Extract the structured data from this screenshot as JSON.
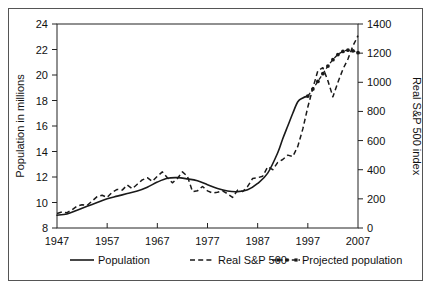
{
  "figure": {
    "background_color": "#ffffff",
    "frame_color": "#555555",
    "ink_color": "#1a1a1a"
  },
  "chart_data": {
    "type": "line",
    "title": "",
    "subtitle": "",
    "xlabel": "",
    "ylabel": "Population in millions",
    "y2label": "Real S&P 500 index",
    "xlim": [
      1947,
      2007
    ],
    "ylim": [
      8,
      24
    ],
    "y2lim": [
      0,
      1400
    ],
    "grid": false,
    "legend_position": "bottom",
    "xticks": [
      1947,
      1957,
      1967,
      1977,
      1987,
      1997,
      2007
    ],
    "xtick_labels": [
      "1947",
      "1957",
      "1967",
      "1977",
      "1987",
      "1997",
      "2007"
    ],
    "yticks": [
      8,
      10,
      12,
      14,
      16,
      18,
      20,
      22,
      24
    ],
    "ytick_labels": [
      "8",
      "10",
      "12",
      "14",
      "16",
      "18",
      "20",
      "22",
      "24"
    ],
    "y2ticks": [
      0,
      200,
      400,
      600,
      800,
      1000,
      1200,
      1400
    ],
    "y2tick_labels": [
      "0",
      "200",
      "400",
      "600",
      "800",
      "1000",
      "1200",
      "1400"
    ],
    "series": [
      {
        "name": "Population",
        "axis": "left",
        "style": "solid",
        "marker": "none",
        "x": [
          1947,
          1949,
          1951,
          1953,
          1955,
          1957,
          1959,
          1961,
          1963,
          1965,
          1967,
          1969,
          1971,
          1973,
          1975,
          1977,
          1979,
          1981,
          1983,
          1985,
          1987,
          1989,
          1991,
          1992,
          1993,
          1994,
          1995,
          1996,
          1997
        ],
        "values": [
          9.0,
          9.1,
          9.4,
          9.7,
          10.0,
          10.3,
          10.5,
          10.7,
          10.9,
          11.2,
          11.6,
          11.9,
          11.95,
          11.85,
          11.7,
          11.4,
          11.1,
          10.9,
          10.85,
          11.0,
          11.5,
          12.3,
          13.9,
          15.0,
          16.0,
          17.0,
          17.9,
          18.2,
          18.35
        ]
      },
      {
        "name": "Real S&P 500",
        "axis": "right",
        "style": "dashed",
        "marker": "none",
        "x": [
          1947,
          1948,
          1949,
          1950,
          1951,
          1952,
          1953,
          1954,
          1955,
          1956,
          1957,
          1958,
          1959,
          1960,
          1961,
          1962,
          1963,
          1964,
          1965,
          1966,
          1967,
          1968,
          1969,
          1970,
          1971,
          1972,
          1973,
          1974,
          1975,
          1976,
          1977,
          1978,
          1979,
          1980,
          1981,
          1982,
          1983,
          1984,
          1985,
          1986,
          1987,
          1988,
          1989,
          1990,
          1991,
          1992,
          1993,
          1994,
          1995,
          1996,
          1997,
          1998,
          1999,
          2000,
          2001,
          2002,
          2003,
          2004,
          2005,
          2006,
          2007
        ],
        "values": [
          100,
          110,
          105,
          125,
          150,
          160,
          155,
          185,
          215,
          225,
          210,
          245,
          265,
          260,
          295,
          270,
          300,
          330,
          345,
          320,
          355,
          385,
          345,
          310,
          340,
          385,
          355,
          250,
          255,
          285,
          255,
          240,
          245,
          255,
          235,
          210,
          260,
          250,
          285,
          340,
          345,
          355,
          420,
          400,
          450,
          470,
          500,
          490,
          560,
          680,
          830,
          960,
          1080,
          1100,
          1010,
          900,
          1000,
          1090,
          1160,
          1250,
          1320
        ]
      },
      {
        "name": "Projected population",
        "axis": "left",
        "style": "dash-dot",
        "marker": "dot",
        "x": [
          1997,
          1998,
          1999,
          2000,
          2001,
          2002,
          2003,
          2004,
          2005,
          2006,
          2007
        ],
        "values": [
          18.35,
          18.9,
          19.5,
          20.1,
          20.7,
          21.2,
          21.6,
          21.85,
          21.95,
          21.9,
          21.75
        ]
      }
    ],
    "legend": [
      {
        "label": "Population",
        "style": "solid",
        "marker": "none"
      },
      {
        "label": "Real S&P 500",
        "style": "dashed",
        "marker": "none"
      },
      {
        "label": "Projected population",
        "style": "dash-dot",
        "marker": "dot"
      }
    ]
  }
}
